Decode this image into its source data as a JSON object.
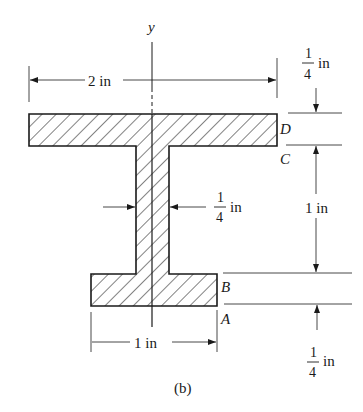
{
  "figure": {
    "caption": "(b)",
    "axis_label": "y",
    "points": {
      "A": "A",
      "B": "B",
      "C": "C",
      "D": "D"
    },
    "dimensions": {
      "top_flange_width": "2 in",
      "top_flange_thickness_num": "1",
      "top_flange_thickness_den": "4",
      "top_flange_thickness_unit": "in",
      "web_thickness_num": "1",
      "web_thickness_den": "4",
      "web_thickness_unit": "in",
      "web_height": "1 in",
      "bottom_flange_width": "1 in",
      "bottom_flange_thickness_num": "1",
      "bottom_flange_thickness_den": "4",
      "bottom_flange_thickness_unit": "in"
    },
    "colors": {
      "line": "#1a1a1a",
      "hatch": "#1a1a1a",
      "background": "#ffffff"
    }
  }
}
